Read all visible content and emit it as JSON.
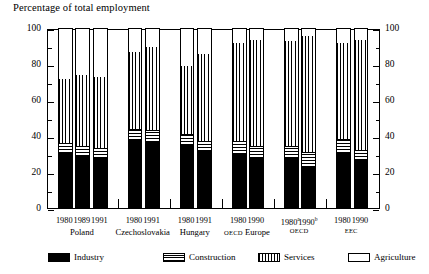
{
  "chart_data": {
    "type": "bar",
    "title": "Percentage of total employment",
    "xlabel": "",
    "ylabel": "",
    "ylim": [
      0,
      100
    ],
    "yticks": [
      0,
      20,
      40,
      60,
      80,
      100
    ],
    "ytick_labels": [
      "0",
      "20",
      "40",
      "60",
      "80",
      "100"
    ],
    "yticks_minor": [
      10,
      30,
      50,
      70,
      90
    ],
    "grid": false,
    "stacked": true,
    "dual_axis": true,
    "legend_position": "below",
    "legend": [
      "Industry",
      "Construction",
      "Services",
      "Agriculture"
    ],
    "series": [
      {
        "name": "Industry",
        "values": [
          30,
          28,
          27,
          37,
          36,
          34,
          31,
          29,
          27,
          27,
          22,
          30,
          26
        ]
      },
      {
        "name": "Construction",
        "values": [
          6,
          6,
          6,
          7,
          7,
          7,
          6,
          8,
          7,
          7,
          9,
          8,
          6
        ]
      },
      {
        "name": "Services",
        "values": [
          36,
          40,
          40,
          43,
          47,
          38,
          49,
          55,
          60,
          59,
          65,
          54,
          62
        ]
      },
      {
        "name": "Agriculture",
        "values": [
          28,
          26,
          27,
          13,
          10,
          21,
          14,
          8,
          6,
          7,
          4,
          8,
          6
        ]
      }
    ],
    "groups": [
      {
        "label": "Poland",
        "label_style": "normal",
        "bars": [
          {
            "year": "1980",
            "sup": ""
          },
          {
            "year": "1989",
            "sup": ""
          },
          {
            "year": "1991",
            "sup": ""
          }
        ]
      },
      {
        "label": "Czechoslovakia",
        "label_style": "normal",
        "bars": [
          {
            "year": "1980",
            "sup": ""
          },
          {
            "year": "1991",
            "sup": ""
          }
        ]
      },
      {
        "label": "Hungary",
        "label_style": "normal",
        "bars": [
          {
            "year": "1980",
            "sup": ""
          },
          {
            "year": "1991",
            "sup": ""
          }
        ]
      },
      {
        "label": "OECD Europe",
        "label_style": "smallcaps",
        "bars": [
          {
            "year": "1980",
            "sup": ""
          },
          {
            "year": "1990",
            "sup": ""
          }
        ]
      },
      {
        "label": "OECD",
        "label_style": "smallcaps",
        "bars": [
          {
            "year": "1980",
            "sup": "a"
          },
          {
            "year": "1990",
            "sup": "b"
          }
        ]
      },
      {
        "label": "EEC",
        "label_style": "smallcaps",
        "bars": [
          {
            "year": "1980",
            "sup": ""
          },
          {
            "year": "1990",
            "sup": ""
          }
        ]
      }
    ],
    "colors": {
      "industry": "#000000",
      "construction": "#000000",
      "services": "#000000",
      "agriculture": "#ffffff",
      "axis": "#000000",
      "background": "#ffffff"
    }
  },
  "axis": {
    "left_labels": [
      "100",
      "80",
      "60",
      "40",
      "20",
      "0"
    ],
    "right_labels": [
      "100",
      "80",
      "60",
      "40",
      "20",
      "0"
    ]
  },
  "legend": {
    "items": [
      {
        "label": "Industry",
        "swatch": "solid-black-swatch"
      },
      {
        "label": "Construction",
        "swatch": "horizontal-stripe-swatch"
      },
      {
        "label": "Services",
        "swatch": "vertical-stripe-swatch"
      },
      {
        "label": "Agriculture",
        "swatch": "white-swatch"
      }
    ]
  }
}
